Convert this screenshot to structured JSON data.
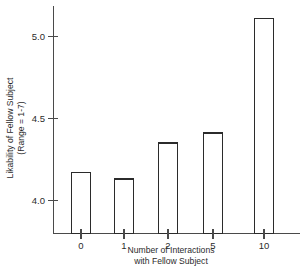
{
  "chart_data": {
    "type": "bar",
    "title": "",
    "categories": [
      "0",
      "1",
      "2",
      "5",
      "10"
    ],
    "values": [
      4.17,
      4.13,
      4.35,
      4.41,
      5.11
    ],
    "xlabel_line1": "Number of Interactions",
    "xlabel_line2": "with Fellow Subject",
    "ylabel_line1": "Likability of Fellow Subject",
    "ylabel_line2": "(Range = 1-7)",
    "ytick_labels": [
      "4.0",
      "4.5",
      "5.0"
    ],
    "ytick_values": [
      4.0,
      4.5,
      5.0
    ],
    "ylim": [
      3.86,
      5.2
    ],
    "xlim_note": "categorical",
    "grid": false,
    "legend": null,
    "bar_fill_color": "#ffffff",
    "bar_edge_color": "#2b2b2b",
    "axis_color": "#4a4a4a"
  },
  "caption": {
    "text": ""
  }
}
